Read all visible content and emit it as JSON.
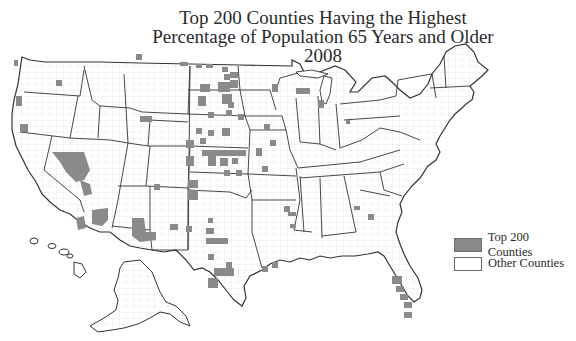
{
  "title": {
    "line1": "Top 200 Counties Having the Highest",
    "line2": "Percentage of Population 65 Years and Older",
    "line3": "2008"
  },
  "legend": {
    "items": [
      {
        "label": "Top 200 Counties",
        "color": "#8a8a8a"
      },
      {
        "label": "Other Counties",
        "color": "#ffffff"
      }
    ]
  },
  "colors": {
    "highlight": "#8a8a8a",
    "background": "#ffffff",
    "state_border": "#333333",
    "county_border": "#cccccc"
  },
  "map": {
    "region": "United States (including Alaska and Hawaii insets)",
    "highlighted_regions": [
      "Great Plains (ND, SD, NE, KS)",
      "Nevada",
      "Arizona",
      "New Mexico",
      "West Texas",
      "Central Texas",
      "Florida Gulf Coast",
      "Upper Michigan",
      "Northern California",
      "Oregon",
      "Montana border",
      "Missouri/Arkansas Ozarks",
      "Pennsylvania",
      "Tennessee"
    ]
  }
}
